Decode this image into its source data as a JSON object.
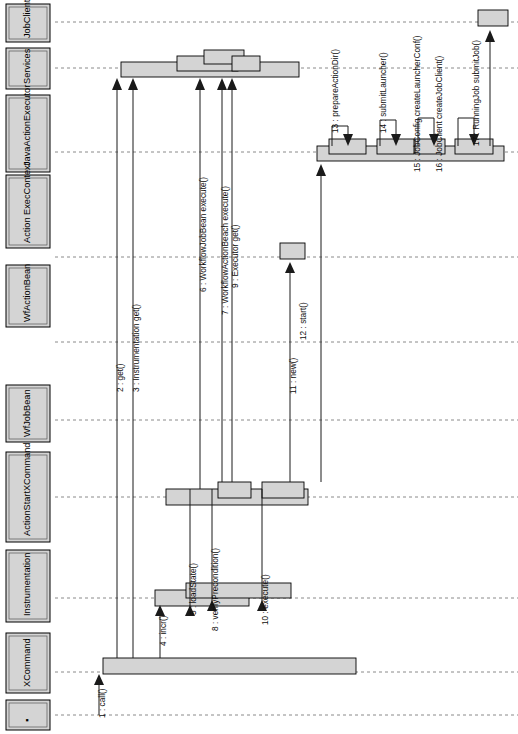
{
  "diagram": {
    "kind": "uml-sequence-diagram",
    "orientation": "rotated-90-counterclockwise",
    "title": "",
    "background_color": "#ffffff",
    "box_fill_color": "#d4d4d4",
    "line_color": "#1a1a1a",
    "lifeline_dash_color": "#8a8a8a"
  },
  "lifelines": [
    {
      "id": "jobclient",
      "label": "JobClient",
      "axis_pos": 22,
      "box_from": 62,
      "box_to": 518
    },
    {
      "id": "services",
      "label": "Services",
      "axis_pos": 68,
      "box_from": 62,
      "box_to": 518
    },
    {
      "id": "javaactionexecutor",
      "label": "JavaActionExecutor",
      "axis_pos": 152,
      "box_from": 62,
      "box_to": 518
    },
    {
      "id": "actionexeccontext",
      "label": "Action ExecContext",
      "axis_pos": 257,
      "box_from": 62,
      "box_to": 518
    },
    {
      "id": "wfactionbean",
      "label": "WfActionBean",
      "axis_pos": 342,
      "box_from": 62,
      "box_to": 518
    },
    {
      "id": "wfjobbean",
      "label": "WfJobBean",
      "axis_pos": 420,
      "box_from": 62,
      "box_to": 518
    },
    {
      "id": "actionstartxcommand",
      "label": "ActionStartXCommand",
      "axis_pos": 497,
      "box_from": 62,
      "box_to": 518
    },
    {
      "id": "instrumentation",
      "label": "Instrumentation",
      "axis_pos": 598,
      "box_from": 62,
      "box_to": 518
    },
    {
      "id": "xcommand",
      "label": "XCommand",
      "axis_pos": 672,
      "box_from": 62,
      "box_to": 518
    },
    {
      "id": "actor",
      "label": "",
      "axis_pos": 715,
      "box_from": 62,
      "box_to": 518
    }
  ],
  "messages": [
    {
      "num": "1",
      "label": "1 : call()",
      "from": "actor",
      "to": "xcommand"
    },
    {
      "num": "2",
      "label": "2 : get()",
      "from": "xcommand",
      "to": "services"
    },
    {
      "num": "3",
      "label": "3 : Instrumentation get()",
      "from": "xcommand",
      "to": "services"
    },
    {
      "num": "4",
      "label": "4 : incr()",
      "from": "xcommand",
      "to": "instrumentation"
    },
    {
      "num": "5",
      "label": "5 : loadState()",
      "from": "actionstartxcommand",
      "to": "instrumentation"
    },
    {
      "num": "6",
      "label": "6 : WorkflowJobBean execute()",
      "from": "actionstartxcommand",
      "to": "services"
    },
    {
      "num": "7",
      "label": "7 : WorkflowActionBeach execute()",
      "from": "actionstartxcommand",
      "to": "services"
    },
    {
      "num": "8",
      "label": "8 : verifyPrecondition()",
      "from": "actionstartxcommand",
      "to": "instrumentation"
    },
    {
      "num": "9",
      "label": "9 : Executor get()",
      "from": "actionstartxcommand",
      "to": "services"
    },
    {
      "num": "10",
      "label": "10 : execute()",
      "from": "actionstartxcommand",
      "to": "instrumentation"
    },
    {
      "num": "11",
      "label": "11 : new()",
      "from": "actionstartxcommand",
      "to": "actionexeccontext"
    },
    {
      "num": "12",
      "label": "12 : start()",
      "from": "actionstartxcommand",
      "to": "javaactionexecutor"
    },
    {
      "num": "13",
      "label": "13 : prepareActionDir()",
      "from": "javaactionexecutor",
      "to": "javaactionexecutor"
    },
    {
      "num": "14",
      "label": "14 : submitLauncher()",
      "from": "javaactionexecutor",
      "to": "javaactionexecutor"
    },
    {
      "num": "15",
      "label": "15 : JobConfig createLauncherConf()",
      "from": "javaactionexecutor",
      "to": "javaactionexecutor"
    },
    {
      "num": "16",
      "label": "16 : JobClient createJobClient()",
      "from": "javaactionexecutor",
      "to": "javaactionexecutor"
    },
    {
      "num": "17",
      "label": "17 : RunningJob submitJob()",
      "from": "javaactionexecutor",
      "to": "jobclient"
    }
  ]
}
